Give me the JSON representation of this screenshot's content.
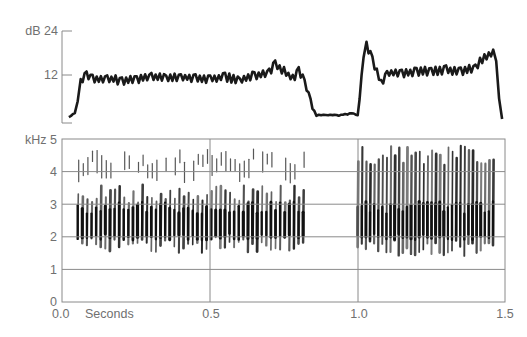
{
  "chart_data": [
    {
      "type": "line",
      "title": "",
      "panel": "amplitude",
      "ylabel": "dB",
      "yticks": [
        {
          "value": 24,
          "label": "dB 24"
        },
        {
          "value": 12,
          "label": "12"
        }
      ],
      "ylim": [
        0,
        24
      ],
      "xlim": [
        0.0,
        1.5
      ],
      "xlabel": "Seconds",
      "series": [
        {
          "name": "amplitude envelope",
          "x": [
            0.02,
            0.04,
            0.05,
            0.06,
            0.08,
            0.1,
            0.15,
            0.2,
            0.25,
            0.3,
            0.35,
            0.4,
            0.45,
            0.5,
            0.55,
            0.6,
            0.65,
            0.7,
            0.72,
            0.75,
            0.78,
            0.8,
            0.82,
            0.84,
            0.86,
            0.9,
            0.95,
            0.98,
            1.0,
            1.02,
            1.03,
            1.05,
            1.08,
            1.1,
            1.15,
            1.2,
            1.25,
            1.3,
            1.35,
            1.4,
            1.43,
            1.46,
            1.47,
            1.48,
            1.49
          ],
          "values": [
            0.5,
            1.5,
            4,
            10,
            12,
            11,
            11,
            10.5,
            11,
            11.5,
            11,
            11.5,
            11,
            11,
            11.5,
            10.5,
            12,
            12.5,
            15,
            13,
            11,
            13,
            10,
            5,
            1,
            1,
            1,
            1.5,
            1,
            16,
            20,
            16,
            10,
            12.5,
            12.5,
            13,
            13,
            13.5,
            13,
            14,
            17,
            18,
            15,
            5,
            0
          ]
        }
      ]
    },
    {
      "type": "heatmap",
      "title": "",
      "panel": "spectrogram",
      "ylabel": "kHz",
      "yticks": [
        0,
        1,
        2,
        3,
        4,
        5
      ],
      "ylim": [
        0,
        5
      ],
      "xlabel": "Seconds",
      "xticks": [
        {
          "value": 0.0,
          "label": "0.0"
        },
        {
          "value": 0.5,
          "label": "0.5"
        },
        {
          "value": 1.0,
          "label": "1.0"
        },
        {
          "value": 1.5,
          "label": "1.5"
        }
      ],
      "xlim": [
        0.0,
        1.5
      ],
      "grid": true,
      "segments": [
        {
          "name": "phrase 1",
          "start_s": 0.05,
          "end_s": 0.82,
          "low_khz": 1.5,
          "high_khz": 4.7,
          "dense_band_khz": [
            2.0,
            3.0
          ],
          "sparse_band_khz": [
            4.0,
            4.6
          ]
        },
        {
          "name": "phrase 2",
          "start_s": 1.0,
          "end_s": 1.46,
          "low_khz": 1.4,
          "high_khz": 4.8,
          "dense_band_khz": [
            1.8,
            4.5
          ]
        }
      ]
    }
  ],
  "labels": {
    "db_axis": "dB 24",
    "db_mid": "12",
    "khz_axis": "kHz 5",
    "x_unit": "Seconds"
  }
}
